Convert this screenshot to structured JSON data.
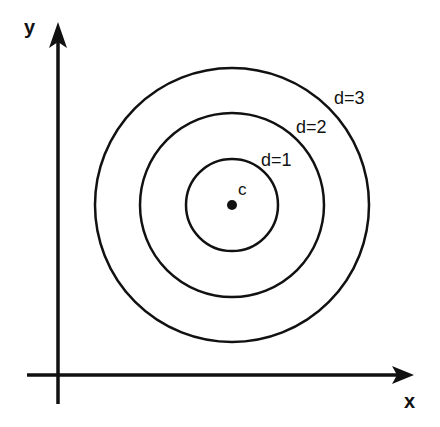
{
  "diagram": {
    "type": "concentric-circles-on-axes",
    "axes": {
      "x_label": "x",
      "y_label": "y"
    },
    "center": {
      "label": "c",
      "x": 232,
      "y": 205
    },
    "circles": [
      {
        "label": "d=1",
        "radius": 46
      },
      {
        "label": "d=2",
        "radius": 92
      },
      {
        "label": "d=3",
        "radius": 137
      }
    ],
    "colors": {
      "stroke": "#111111",
      "background": "#ffffff"
    }
  }
}
